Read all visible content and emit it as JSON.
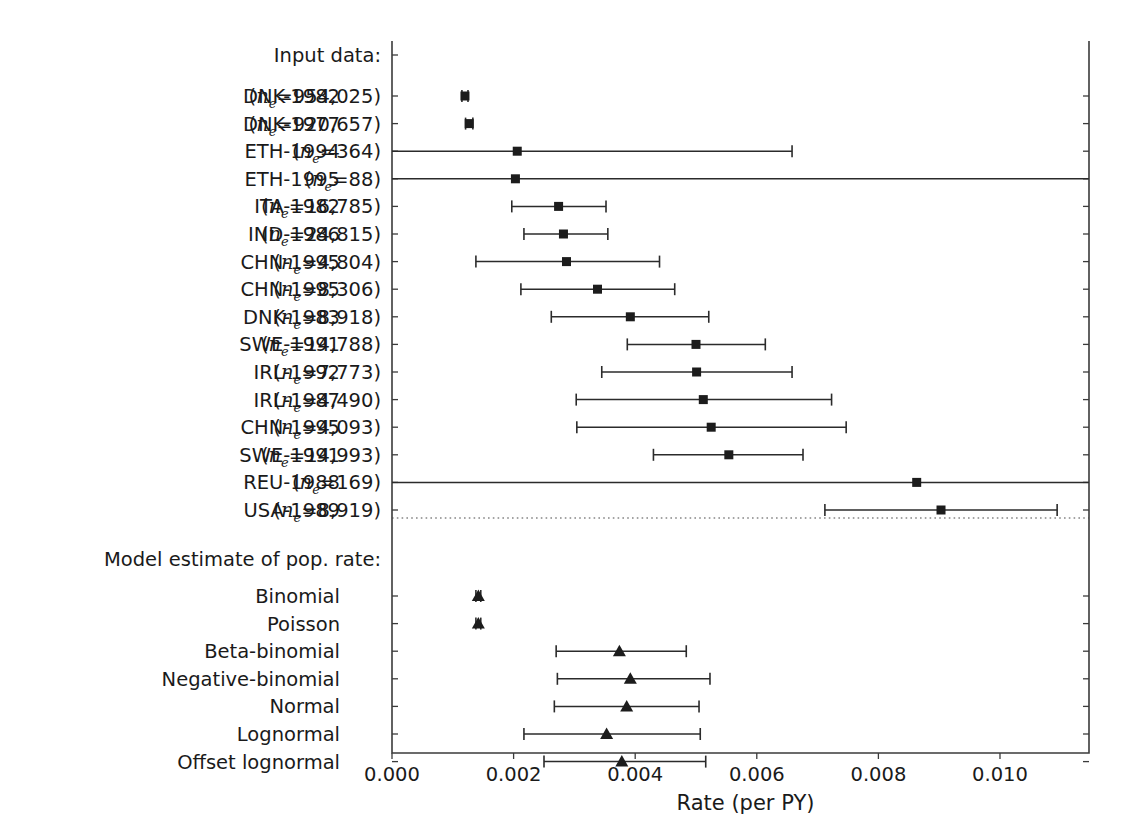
{
  "chart_data": {
    "type": "scatter",
    "title": "",
    "xlabel": "Rate (per PY)",
    "ylabel": "",
    "xlim": [
      0.0,
      0.011464
    ],
    "xticks": [
      0.0,
      0.002,
      0.004,
      0.006,
      0.008,
      0.01
    ],
    "xticklabels": [
      "0.000",
      "0.002",
      "0.004",
      "0.006",
      "0.008",
      "0.010"
    ],
    "grid": false,
    "legend": "none",
    "orientation": "horizontal",
    "sections": [
      {
        "id": "input-data",
        "heading": "Input data:",
        "marker": "square",
        "rows": [
          {
            "country": "DNK-1982",
            "n_e": "954,025",
            "label_left": "DNK-1982",
            "label_right": "(n_e=954,025)",
            "estimate": 0.0012,
            "ci_low": 0.00115,
            "ci_high": 0.00125
          },
          {
            "country": "DNK-1977",
            "n_e": "920,657",
            "label_left": "DNK-1977",
            "label_right": "(n_e=920,657)",
            "estimate": 0.00127,
            "ci_low": 0.00121,
            "ci_high": 0.00133
          },
          {
            "country": "ETH-1994",
            "n_e": "364",
            "label_left": "ETH-1994",
            "label_right": "(n_e=364)",
            "estimate": 0.00206,
            "ci_low": 0.0,
            "ci_high": 0.00658
          },
          {
            "country": "ETH-1995",
            "n_e": "88",
            "label_left": "ETH-1995",
            "label_right": "(n_e=88)",
            "estimate": 0.00203,
            "ci_low": 0.0,
            "ci_high": 0.01146
          },
          {
            "country": "ITA-1982",
            "n_e": "16,785",
            "label_left": "ITA-1982",
            "label_right": "(n_e=16,785)",
            "estimate": 0.00274,
            "ci_low": 0.00197,
            "ci_high": 0.00352
          },
          {
            "country": "IND-1986",
            "n_e": "24,815",
            "label_left": "IND-1986",
            "label_right": "(n_e=24,815)",
            "estimate": 0.00282,
            "ci_low": 0.00217,
            "ci_high": 0.00355
          },
          {
            "country": "CHN-1995",
            "n_e": "4,804",
            "label_left": "CHN-1995",
            "label_right": "(n_e=4,804)",
            "estimate": 0.00287,
            "ci_low": 0.00138,
            "ci_high": 0.0044
          },
          {
            "country": "CHN-1995",
            "n_e": "8,306",
            "label_left": "CHN-1995",
            "label_right": "(n_e=8,306)",
            "estimate": 0.00338,
            "ci_low": 0.00212,
            "ci_high": 0.00465
          },
          {
            "country": "DNK-1983",
            "n_e": "8,918",
            "label_left": "DNK-1983",
            "label_right": "(n_e=8,918)",
            "estimate": 0.00392,
            "ci_low": 0.00262,
            "ci_high": 0.00521
          },
          {
            "country": "SWE-1991",
            "n_e": "14,788",
            "label_left": "SWE-1991",
            "label_right": "(n_e=14,788)",
            "estimate": 0.005,
            "ci_low": 0.00387,
            "ci_high": 0.00614
          },
          {
            "country": "IRL-1992",
            "n_e": "7,773",
            "label_left": "IRL-1992",
            "label_right": "(n_e=7,773)",
            "estimate": 0.00501,
            "ci_low": 0.00345,
            "ci_high": 0.00658
          },
          {
            "country": "IRL-1987",
            "n_e": "4,490",
            "label_left": "IRL-1987",
            "label_right": "(n_e=4,490)",
            "estimate": 0.00512,
            "ci_low": 0.00303,
            "ci_high": 0.00723
          },
          {
            "country": "CHN-1995",
            "n_e": "4,093",
            "label_left": "CHN-1995",
            "label_right": "(n_e=4,093)",
            "estimate": 0.00525,
            "ci_low": 0.00304,
            "ci_high": 0.00747
          },
          {
            "country": "SWE-1991",
            "n_e": "14,993",
            "label_left": "SWE-1991",
            "label_right": "(n_e=14,993)",
            "estimate": 0.00554,
            "ci_low": 0.0043,
            "ci_high": 0.00676
          },
          {
            "country": "REU-1988",
            "n_e": "169",
            "label_left": "REU-1988",
            "label_right": "(n_e=169)",
            "estimate": 0.00863,
            "ci_low": 0.0,
            "ci_high": 0.01146
          },
          {
            "country": "USA-1989",
            "n_e": "8,919",
            "label_left": "USA-1989",
            "label_right": "(n_e=8,919)",
            "estimate": 0.00903,
            "ci_low": 0.00712,
            "ci_high": 0.01094
          }
        ]
      },
      {
        "id": "model-estimate",
        "heading": "Model estimate of pop. rate:",
        "marker": "triangle",
        "rows": [
          {
            "label_left": "Binomial",
            "label_right": "",
            "estimate": 0.00142,
            "ci_low": 0.00138,
            "ci_high": 0.00146
          },
          {
            "label_left": "Poisson",
            "label_right": "",
            "estimate": 0.00142,
            "ci_low": 0.00138,
            "ci_high": 0.00146
          },
          {
            "label_left": "Beta-binomial",
            "label_right": "",
            "estimate": 0.00374,
            "ci_low": 0.0027,
            "ci_high": 0.00484
          },
          {
            "label_left": "Negative-binomial",
            "label_right": "",
            "estimate": 0.00392,
            "ci_low": 0.00272,
            "ci_high": 0.00523
          },
          {
            "label_left": "Normal",
            "label_right": "",
            "estimate": 0.00386,
            "ci_low": 0.00267,
            "ci_high": 0.00505
          },
          {
            "label_left": "Lognormal",
            "label_right": "",
            "estimate": 0.00353,
            "ci_low": 0.00217,
            "ci_high": 0.00507
          },
          {
            "label_left": "Offset lognormal",
            "label_right": "",
            "estimate": 0.00378,
            "ci_low": 0.0025,
            "ci_high": 0.00516
          }
        ]
      }
    ]
  },
  "axis": {
    "xlabel": "Rate (per PY)",
    "tick_labels": [
      "0.000",
      "0.002",
      "0.004",
      "0.006",
      "0.008",
      "0.010"
    ]
  },
  "headings": {
    "input_data": "Input data:",
    "model_estimate": "Model estimate of pop. rate:"
  },
  "symbols": {
    "n_e_base": "n",
    "n_e_sub": "e",
    "equals": "="
  },
  "colors": {
    "axis": "#3b3b3b",
    "marker": "#1c1c1c",
    "ci": "#2b2b2b",
    "text": "#1a1a1a",
    "background": "#ffffff"
  }
}
